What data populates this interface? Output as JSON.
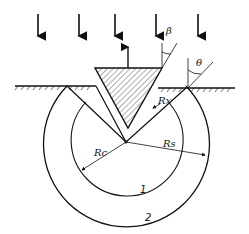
{
  "figure": {
    "labels": {
      "beta": "β",
      "theta": "θ",
      "rx": "Rx",
      "rc": "Rc",
      "rs": "Rs",
      "zone1": "1",
      "zone2": "2"
    },
    "load_arrows": {
      "count": 5,
      "direction": "down"
    },
    "reaction_arrow": {
      "direction": "up"
    },
    "colors": {
      "line": "#111111",
      "hatch": "#333333",
      "background": "#ffffff"
    }
  }
}
